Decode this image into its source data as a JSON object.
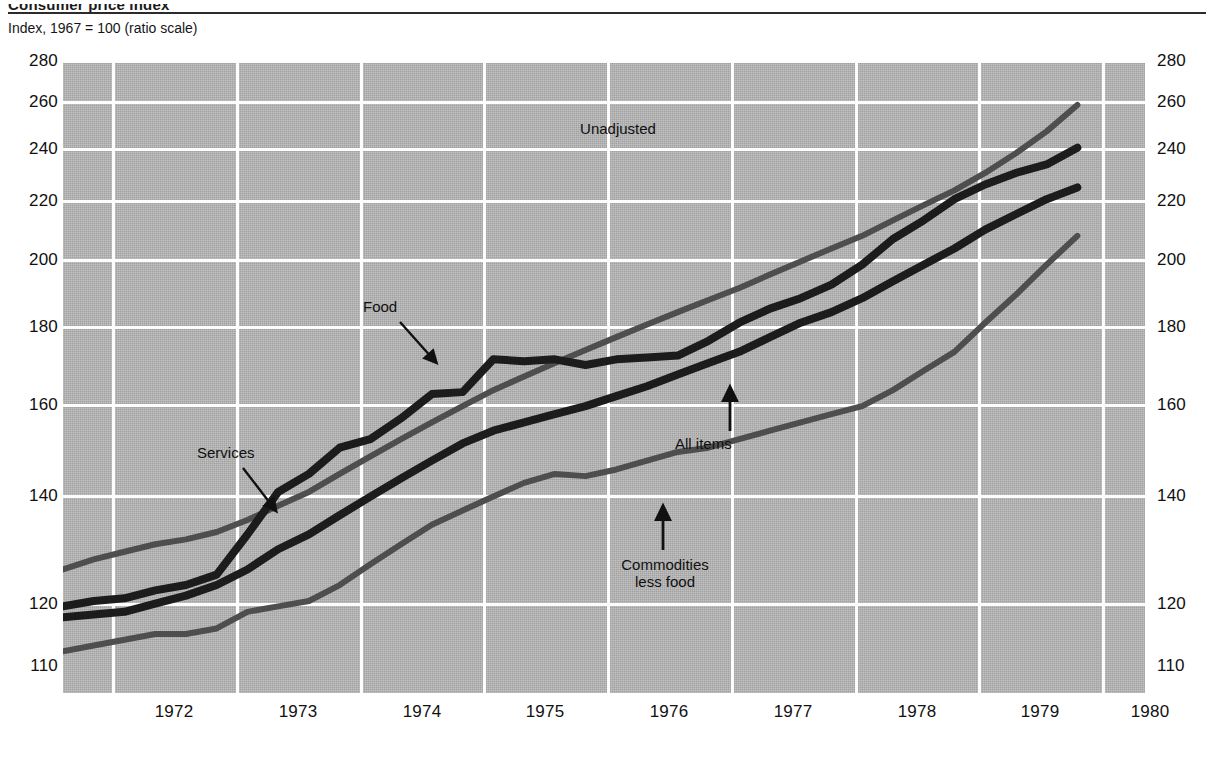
{
  "header": {
    "title": "Consumer price index",
    "axis_note": "Index, 1967 = 100 (ratio scale)"
  },
  "annotations": {
    "unadjusted": "Unadjusted",
    "food": "Food",
    "services": "Services",
    "all_items": "All items",
    "commodities_line1": "Commodities",
    "commodities_line2": "less food"
  },
  "colors": {
    "plot_background": "#b5b5b5",
    "gridline": "#fdfdfd",
    "series_dark": "#1c1c1c",
    "series_gray": "#4e4e4e",
    "text": "#111111"
  },
  "chart_data": {
    "type": "line",
    "title": "Consumer price index",
    "subtitle": "Index, 1967 = 100 (ratio scale)",
    "xlabel": "",
    "ylabel": "Index, 1967 = 100",
    "scale": "log",
    "grid": true,
    "legend": "inline-annotations",
    "xlim": [
      1971.6,
      1980.4
    ],
    "ylim": [
      110,
      280
    ],
    "ytick_labels": [
      "280",
      "260",
      "240",
      "220",
      "200",
      "180",
      "160",
      "140",
      "120",
      "110"
    ],
    "ytick_values": [
      280,
      260,
      240,
      220,
      200,
      180,
      160,
      140,
      120,
      110
    ],
    "xtick_labels": [
      "1972",
      "1973",
      "1974",
      "1975",
      "1976",
      "1977",
      "1978",
      "1979",
      "1980"
    ],
    "xtick_values": [
      1972,
      1973,
      1974,
      1975,
      1976,
      1977,
      1978,
      1979,
      1980
    ],
    "x": [
      1971.6,
      1971.85,
      1972.1,
      1972.35,
      1972.6,
      1972.85,
      1973.1,
      1973.35,
      1973.6,
      1973.85,
      1974.1,
      1974.35,
      1974.6,
      1974.85,
      1975.1,
      1975.35,
      1975.6,
      1975.85,
      1976.1,
      1976.35,
      1976.6,
      1976.85,
      1977.1,
      1977.35,
      1977.6,
      1977.85,
      1978.1,
      1978.35,
      1978.6,
      1978.85,
      1979.1,
      1979.35,
      1979.6,
      1979.85
    ],
    "series": [
      {
        "name": "Services",
        "color": "#4e4e4e",
        "values": [
          132,
          134,
          135.5,
          137,
          138,
          139.5,
          142,
          145,
          148,
          152,
          156,
          160,
          164,
          168,
          172,
          175.5,
          179,
          182.5,
          186,
          189.5,
          193,
          196.5,
          200,
          204,
          208,
          212,
          216,
          221,
          226,
          231,
          237,
          244,
          252,
          262
        ]
      },
      {
        "name": "Food",
        "color": "#1c1c1c",
        "values": [
          125,
          126,
          126.5,
          128,
          129,
          131,
          139,
          148,
          152,
          158,
          160,
          165,
          171,
          171.5,
          180,
          179.5,
          180,
          178.5,
          180,
          180.5,
          181,
          185,
          190,
          194,
          197,
          201,
          207,
          215,
          221,
          228,
          233,
          237,
          240,
          246
        ]
      },
      {
        "name": "All items",
        "color": "#1c1c1c",
        "values": [
          123,
          123.5,
          124,
          125.5,
          127,
          129,
          132,
          136,
          139,
          143,
          147,
          151,
          155,
          159,
          162,
          164,
          166,
          168,
          170.5,
          173,
          176,
          179,
          182,
          186,
          190,
          193,
          197,
          202,
          207,
          212,
          218,
          223,
          228,
          232
        ]
      },
      {
        "name": "Commodities less food",
        "color": "#4e4e4e",
        "values": [
          117,
          118,
          119,
          120,
          120,
          121,
          124,
          125,
          126,
          129,
          133,
          137,
          141,
          144,
          147,
          150,
          152,
          151.5,
          153,
          155,
          157,
          158,
          160,
          162,
          164,
          166,
          168,
          172,
          177,
          182,
          190,
          198,
          207,
          216
        ]
      }
    ]
  }
}
